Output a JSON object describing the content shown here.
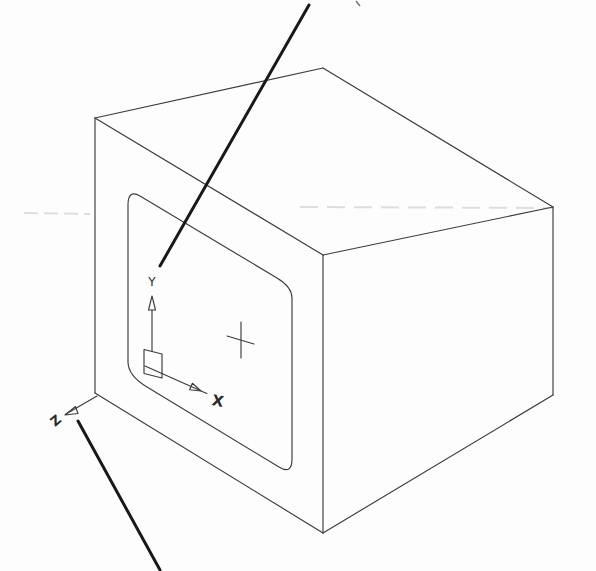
{
  "figure": {
    "axis_labels": {
      "x": "X",
      "y": "Y",
      "z": "Z"
    },
    "colors": {
      "background": "#fdfdfd",
      "outline": "#3c3c3c",
      "leader_line": "#191919",
      "artifact": "#dedede"
    }
  }
}
